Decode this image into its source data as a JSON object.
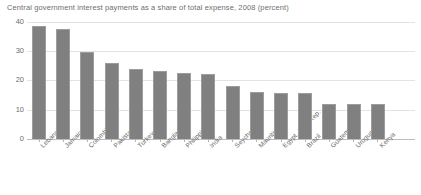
{
  "chart_data": {
    "type": "bar",
    "title": "Central government interest payments as a share of total expense, 2008 (percent)",
    "xlabel": "",
    "ylabel": "",
    "ylim": [
      0,
      40
    ],
    "yticks": [
      0,
      10,
      20,
      30,
      40
    ],
    "grid": true,
    "legend": "none",
    "bar_color": "#808080",
    "categories": [
      "Lebanon",
      "Jamaica",
      "Colombia",
      "Pakistan",
      "Turkey",
      "Bangladesh",
      "Philippines",
      "India",
      "Seychelles",
      "Mauritius",
      "Egypt, Arab Rep.",
      "Brazil",
      "Guatemala",
      "Uruguay",
      "Kenya"
    ],
    "values": [
      38.5,
      37.5,
      29.5,
      26,
      24,
      23,
      22.5,
      22,
      18,
      16,
      15.5,
      15.5,
      12,
      11.8,
      12
    ]
  }
}
